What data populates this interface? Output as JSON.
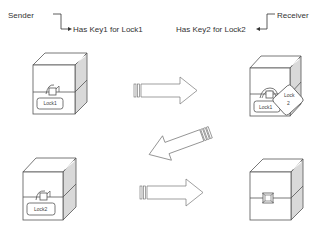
{
  "labels": {
    "sender": "Sender",
    "receiver": "Receiver",
    "sender_key": "Has Key1 for Lock1",
    "receiver_key": "Has Key2 for Lock2"
  },
  "boxes": [
    {
      "id": "box-1",
      "position": "top-left",
      "locks": [
        "Lock1"
      ]
    },
    {
      "id": "box-2",
      "position": "top-right",
      "locks": [
        "Lock1",
        "Lock 2"
      ]
    },
    {
      "id": "box-3",
      "position": "bottom-left",
      "locks": [
        "Lock2"
      ]
    },
    {
      "id": "box-4",
      "position": "bottom-right",
      "locks": []
    }
  ],
  "lock_tags": {
    "box1": "Lock1",
    "box2_under": "Lock1",
    "box2_top_line1": "Lock",
    "box2_top_line2": "2",
    "box3": "Lock2"
  },
  "arrows": [
    {
      "id": "arrow-1",
      "direction": "right",
      "from": "box-1",
      "to": "box-2"
    },
    {
      "id": "arrow-2",
      "direction": "down-left",
      "from": "box-2",
      "to": "box-3"
    },
    {
      "id": "arrow-3",
      "direction": "right",
      "from": "box-3",
      "to": "box-4"
    }
  ],
  "colors": {
    "stroke": "#555555",
    "side_face": "#d9d9d9",
    "background": "#ffffff"
  }
}
